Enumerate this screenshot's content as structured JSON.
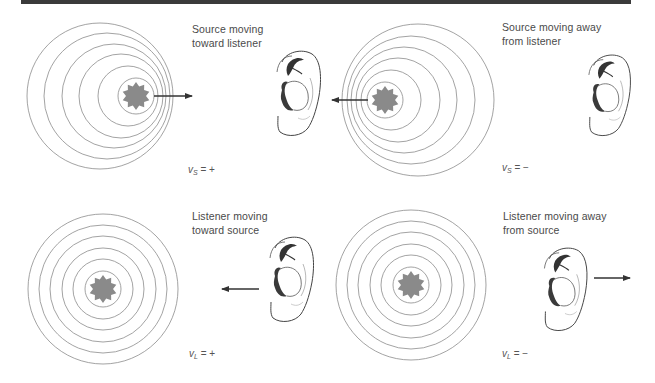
{
  "figure": {
    "panels": [
      {
        "id": "source-toward",
        "caption_line1": "Source moving",
        "caption_line2": "toward listener",
        "variable": "v",
        "subscript": "S",
        "equation_rest": " = +",
        "arrow_direction": "right",
        "moving_object": "source"
      },
      {
        "id": "source-away",
        "caption_line1": "Source moving away",
        "caption_line2": "from listener",
        "variable": "v",
        "subscript": "S",
        "equation_rest": " = −",
        "arrow_direction": "left",
        "moving_object": "source"
      },
      {
        "id": "listener-toward",
        "caption_line1": "Listener moving",
        "caption_line2": "toward source",
        "variable": "v",
        "subscript": "L",
        "equation_rest": " = +",
        "arrow_direction": "left",
        "moving_object": "listener"
      },
      {
        "id": "listener-away",
        "caption_line1": "Listener moving away",
        "caption_line2": "from source",
        "variable": "v",
        "subscript": "L",
        "equation_rest": " = −",
        "arrow_direction": "right",
        "moving_object": "listener"
      }
    ],
    "icons": {
      "source": "sound-source-star-icon",
      "listener": "ear-icon",
      "wavefronts": "wavefront-circles"
    },
    "colors": {
      "top_bar": "#3a3a3a",
      "wavefront": "#8c8c8c",
      "source_fill": "#8a8a8a",
      "arrow": "#333333",
      "text": "#4a4a4a"
    }
  }
}
